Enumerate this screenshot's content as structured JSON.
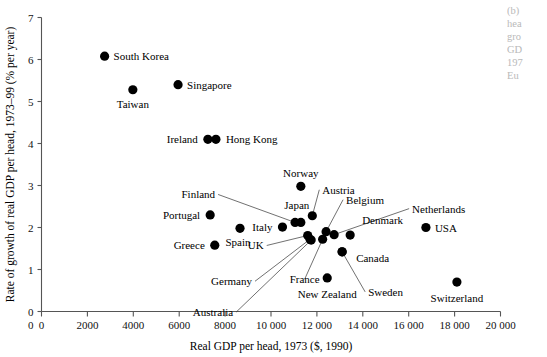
{
  "chart_data": {
    "type": "scatter",
    "title": "",
    "xlabel": "Real GDP per head, 1973 ($, 1990)",
    "ylabel": "Rate of growth of real GDP per head, 1973–99 (% per year)",
    "xlim": [
      0,
      20000
    ],
    "ylim": [
      0,
      7
    ],
    "xticks": [
      0,
      2000,
      4000,
      6000,
      8000,
      10000,
      12000,
      14000,
      16000,
      18000,
      20000
    ],
    "xtick_labels": [
      "0",
      "2000",
      "4000",
      "6000",
      "8000",
      "10 000",
      "12 000",
      "14 000",
      "16 000",
      "18 000",
      "20 000"
    ],
    "yticks": [
      0,
      1,
      2,
      3,
      4,
      5,
      6,
      7
    ],
    "ytick_labels": [
      "0",
      "1",
      "2",
      "3",
      "4",
      "5",
      "6",
      "7"
    ],
    "grid": false,
    "legend": "none",
    "marker_color": "#000000",
    "points": [
      {
        "name": "South Korea",
        "x": 2750,
        "y": 6.08,
        "label_dx": 9,
        "label_dy": 4,
        "anchor": "start",
        "leader": false
      },
      {
        "name": "Singapore",
        "x": 5950,
        "y": 5.4,
        "label_dx": 9,
        "label_dy": 4,
        "anchor": "start",
        "leader": false
      },
      {
        "name": "Taiwan",
        "x": 3980,
        "y": 5.28,
        "label_dx": 0,
        "label_dy": 18,
        "anchor": "middle",
        "leader": false
      },
      {
        "name": "Ireland",
        "x": 7250,
        "y": 4.1,
        "label_dx": -10,
        "label_dy": 4,
        "anchor": "end",
        "leader": false
      },
      {
        "name": "Hong Kong",
        "x": 7600,
        "y": 4.1,
        "label_dx": 10,
        "label_dy": 4,
        "anchor": "start",
        "leader": false
      },
      {
        "name": "Norway",
        "x": 11300,
        "y": 2.98,
        "label_dx": 0,
        "label_dy": -9,
        "anchor": "middle",
        "leader": false
      },
      {
        "name": "Finland",
        "x": 11050,
        "y": 2.12,
        "label_dx": -80,
        "label_dy": -24,
        "anchor": "end",
        "leader": true
      },
      {
        "name": "Austria",
        "x": 11800,
        "y": 2.28,
        "label_dx": 10,
        "label_dy": -22,
        "anchor": "start",
        "leader": true
      },
      {
        "name": "Japan",
        "x": 11300,
        "y": 2.12,
        "label_dx": -4,
        "label_dy": -13,
        "anchor": "middle",
        "leader": false
      },
      {
        "name": "Italy",
        "x": 10500,
        "y": 2.01,
        "label_dx": -10,
        "label_dy": 4,
        "anchor": "end",
        "leader": false
      },
      {
        "name": "Belgium",
        "x": 12400,
        "y": 1.9,
        "label_dx": 20,
        "label_dy": -28,
        "anchor": "start",
        "leader": true
      },
      {
        "name": "Netherlands",
        "x": 12750,
        "y": 1.83,
        "label_dx": 78,
        "label_dy": -22,
        "anchor": "start",
        "leader": true
      },
      {
        "name": "Denmark",
        "x": 13450,
        "y": 1.82,
        "label_dx": 12,
        "label_dy": -11,
        "anchor": "start",
        "leader": false
      },
      {
        "name": "UK",
        "x": 11600,
        "y": 1.81,
        "label_dx": -44,
        "label_dy": 14,
        "anchor": "end",
        "leader": true
      },
      {
        "name": "Germany",
        "x": 11700,
        "y": 1.72,
        "label_dx": -58,
        "label_dy": 46,
        "anchor": "end",
        "leader": true
      },
      {
        "name": "Canada",
        "x": 13100,
        "y": 1.42,
        "label_dx": 14,
        "label_dy": 10,
        "anchor": "start",
        "leader": false
      },
      {
        "name": "France",
        "x": 12250,
        "y": 1.72,
        "label_dx": -18,
        "label_dy": 44,
        "anchor": "middle",
        "leader": true
      },
      {
        "name": "Sweden",
        "x": 13100,
        "y": 1.42,
        "label_dx": 26,
        "label_dy": 44,
        "anchor": "start",
        "leader": true
      },
      {
        "name": "Australia",
        "x": 11750,
        "y": 1.7,
        "label_dx": -78,
        "label_dy": 76,
        "anchor": "end",
        "leader": true
      },
      {
        "name": "New Zealand",
        "x": 12450,
        "y": 0.8,
        "label_dx": 0,
        "label_dy": 20,
        "anchor": "middle",
        "leader": false
      },
      {
        "name": "Portugal",
        "x": 7350,
        "y": 2.3,
        "label_dx": -10,
        "label_dy": 4,
        "anchor": "end",
        "leader": false
      },
      {
        "name": "Spain",
        "x": 8650,
        "y": 1.98,
        "label_dx": -2,
        "label_dy": 18,
        "anchor": "middle",
        "leader": false
      },
      {
        "name": "Greece",
        "x": 7550,
        "y": 1.58,
        "label_dx": -10,
        "label_dy": 4,
        "anchor": "end",
        "leader": false
      },
      {
        "name": "USA",
        "x": 16750,
        "y": 2.0,
        "label_dx": 9,
        "label_dy": 4,
        "anchor": "start",
        "leader": false
      },
      {
        "name": "Switzerland",
        "x": 18100,
        "y": 0.7,
        "label_dx": 0,
        "label_dy": 20,
        "anchor": "middle",
        "leader": false
      }
    ]
  },
  "caption_fragment": {
    "lines": [
      "(b)",
      "hea",
      "gro",
      "GD",
      "197",
      "Eu"
    ]
  }
}
